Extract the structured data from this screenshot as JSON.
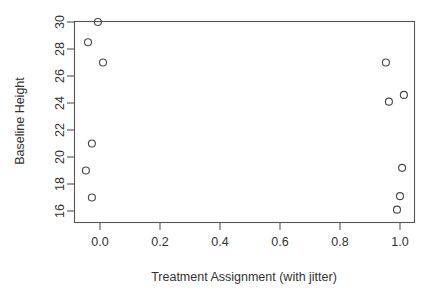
{
  "chart_data": {
    "type": "scatter",
    "title": "",
    "xlabel": "Treatment Assignment (with jitter)",
    "ylabel": "Baseline Height",
    "xlim": [
      -0.086,
      1.066
    ],
    "ylim": [
      15.4,
      30.5
    ],
    "xticks": [
      0.0,
      0.2,
      0.4,
      0.6,
      0.8,
      1.0
    ],
    "xtick_labels": [
      "0.0",
      "0.2",
      "0.4",
      "0.6",
      "0.8",
      "1.0"
    ],
    "yticks": [
      16,
      18,
      20,
      22,
      24,
      26,
      28,
      30
    ],
    "ytick_labels": [
      "16",
      "18",
      "20",
      "22",
      "24",
      "26",
      "28",
      "30"
    ],
    "grid": false,
    "legend": null,
    "marker": "open-circle",
    "marker_color": "#4a4a4a",
    "marker_radius_px": 3.5,
    "points": [
      {
        "x": -0.007,
        "y": 30.0,
        "group": "control"
      },
      {
        "x": -0.04,
        "y": 28.5,
        "group": "control"
      },
      {
        "x": 0.01,
        "y": 27.0,
        "group": "control"
      },
      {
        "x": -0.027,
        "y": 21.0,
        "group": "control"
      },
      {
        "x": -0.047,
        "y": 19.0,
        "group": "control"
      },
      {
        "x": -0.027,
        "y": 17.0,
        "group": "control"
      },
      {
        "x": 0.953,
        "y": 27.0,
        "group": "treatment"
      },
      {
        "x": 0.963,
        "y": 24.1,
        "group": "treatment"
      },
      {
        "x": 1.013,
        "y": 24.6,
        "group": "treatment"
      },
      {
        "x": 1.007,
        "y": 19.2,
        "group": "treatment"
      },
      {
        "x": 1.0,
        "y": 17.1,
        "group": "treatment"
      },
      {
        "x": 0.99,
        "y": 16.1,
        "group": "treatment"
      }
    ]
  },
  "layout": {
    "plot_left_px": 74,
    "plot_right_px": 414,
    "plot_top_px": 21,
    "plot_bottom_px": 222,
    "x_zero_px": 100,
    "x_one_px": 400,
    "y_30_px": 22,
    "y_16_px": 211
  }
}
